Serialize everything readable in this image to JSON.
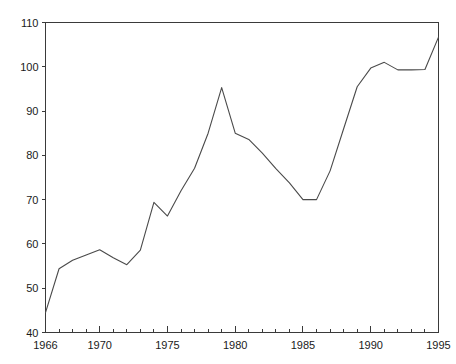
{
  "chart_data": {
    "type": "line",
    "title": "",
    "subtitle": "",
    "xlabel": "",
    "ylabel": "",
    "xlim": [
      1966,
      1995
    ],
    "ylim": [
      40,
      110
    ],
    "grid": false,
    "legend": null,
    "x": [
      1966,
      1967,
      1968,
      1969,
      1970,
      1971,
      1972,
      1973,
      1974,
      1975,
      1976,
      1977,
      1978,
      1979,
      1980,
      1981,
      1982,
      1983,
      1984,
      1985,
      1986,
      1987,
      1988,
      1989,
      1990,
      1991,
      1992,
      1993,
      1994,
      1995
    ],
    "values": [
      44.5,
      54.4,
      56.3,
      57.5,
      58.7,
      56.9,
      55.3,
      58.6,
      69.4,
      66.3,
      72.0,
      77.1,
      85.0,
      95.3,
      85.0,
      83.6,
      80.5,
      77.0,
      73.8,
      70.0,
      70.0,
      76.5,
      86.0,
      95.5,
      99.7,
      101.0,
      99.3,
      99.3,
      99.4,
      106.7
    ],
    "y_ticks": [
      40,
      50,
      60,
      70,
      80,
      90,
      100,
      110
    ],
    "y_tick_labels": [
      "40",
      "50",
      "60",
      "70",
      "80",
      "90",
      "100",
      "110"
    ],
    "x_ticks_major": [
      1966,
      1970,
      1975,
      1980,
      1985,
      1990,
      1995
    ],
    "x_tick_labels": [
      "1966",
      "1970",
      "1975",
      "1980",
      "1985",
      "1990",
      "1995"
    ],
    "x_ticks_minor": [
      1967,
      1968,
      1969,
      1971,
      1972,
      1973,
      1974,
      1976,
      1977,
      1978,
      1979,
      1981,
      1982,
      1983,
      1984,
      1986,
      1987,
      1988,
      1989,
      1991,
      1992,
      1993,
      1994
    ],
    "line_color": "#4a4a4a",
    "axis_color": "#3a3a3a",
    "background_color": "#ffffff"
  }
}
